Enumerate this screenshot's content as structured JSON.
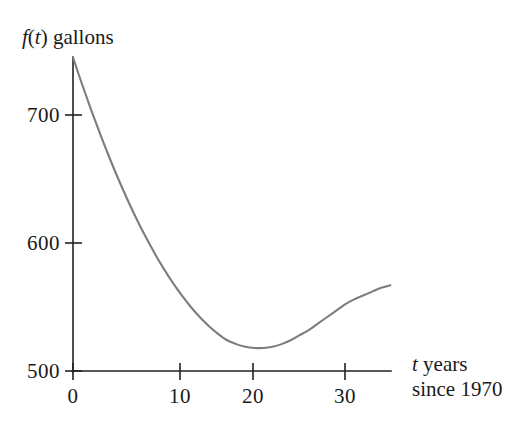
{
  "chart_data": {
    "type": "line",
    "title": "",
    "subtitle": "",
    "xlabel": "t years since 1970",
    "ylabel": "f(t) gallons",
    "xlabel_parts": {
      "variable": "t",
      "rest": " years",
      "line2": "since 1970"
    },
    "ylabel_parts": {
      "function": "f",
      "open": "(",
      "variable": "t",
      "close": ")",
      "rest": " gallons"
    },
    "xlim": [
      0,
      35
    ],
    "ylim": [
      500,
      760
    ],
    "xticks": [
      0,
      10,
      20,
      30
    ],
    "xtick_labels": [
      "0",
      "10",
      "20",
      "30"
    ],
    "yticks": [
      500,
      600,
      700
    ],
    "ytick_labels": [
      "500",
      "600",
      "700"
    ],
    "grid": false,
    "legend": null,
    "legend_position": "none",
    "annotations": [],
    "series": [
      {
        "name": "f(t)",
        "color": "#7d7d7d",
        "x": [
          0,
          1,
          2,
          3,
          4,
          5,
          6,
          7,
          8,
          9,
          10,
          11,
          12,
          13,
          14,
          15,
          16,
          17,
          18,
          19,
          20,
          21,
          22,
          23,
          24,
          25,
          26,
          27,
          28,
          29,
          30,
          31,
          32,
          33,
          34,
          35
        ],
        "y": [
          745,
          724,
          704,
          685,
          667,
          650,
          634,
          619,
          605,
          592,
          580,
          569,
          559,
          550,
          542,
          535,
          529,
          524,
          521,
          519,
          518,
          518,
          519,
          521,
          524,
          528,
          532,
          537,
          542,
          547,
          552,
          556,
          559,
          562,
          565,
          567
        ]
      }
    ],
    "minimum_point": {
      "t": 21,
      "value": 518
    },
    "start_point": {
      "t": 0,
      "value": 745
    },
    "end_point": {
      "t": 35,
      "value": 567
    }
  },
  "colors": {
    "curve": "#7d7d7d",
    "axis": "#222222",
    "text": "#1a1a1a",
    "background": "#ffffff"
  }
}
